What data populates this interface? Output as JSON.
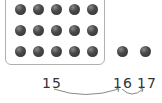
{
  "diagram": {
    "ten_frame_rows": 3,
    "ten_frame_cols": 5,
    "frame_dots": 15,
    "extra_dots": 2,
    "labels": [
      "15",
      "16",
      "17"
    ],
    "arrows": [
      {
        "from": "15",
        "to": "16"
      },
      {
        "from": "16",
        "to": "17"
      }
    ],
    "colors": {
      "dot": "#3a3a3a",
      "frame": "#b0b0b0",
      "arrow": "#888888",
      "text": "#333333"
    }
  }
}
